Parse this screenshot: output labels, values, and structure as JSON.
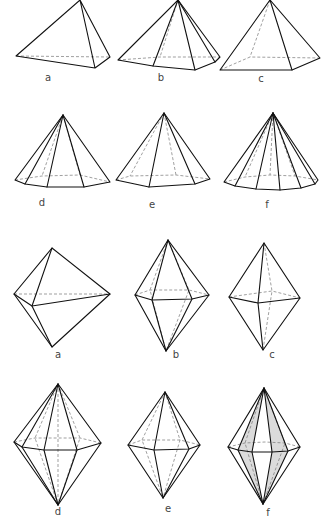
{
  "diagram": {
    "title": "",
    "width": 324,
    "height": 524,
    "colors": {
      "line": "#111111",
      "hidden_line": "#777777",
      "shade": "#cfcfcf",
      "label": "#444444"
    }
  },
  "pyramids": [
    {
      "id": "a",
      "label": "a",
      "label_pos": [
        48,
        81
      ],
      "solid": [
        [
          [
            80,
            0
          ],
          [
            16,
            56
          ],
          [
            95,
            68
          ],
          [
            80,
            0
          ],
          [
            110,
            57
          ],
          [
            95,
            68
          ]
        ]
      ],
      "hidden": [
        [
          [
            16,
            56
          ],
          [
            110,
            57
          ]
        ]
      ],
      "shade": []
    },
    {
      "id": "b",
      "label": "b",
      "label_pos": [
        161,
        81
      ],
      "solid": [
        [
          [
            178,
            0
          ],
          [
            118,
            60
          ],
          [
            153,
            66
          ],
          [
            195,
            70
          ],
          [
            215,
            62
          ],
          [
            220,
            57
          ],
          [
            178,
            0
          ]
        ],
        [
          [
            178,
            0
          ],
          [
            153,
            66
          ]
        ],
        [
          [
            178,
            0
          ],
          [
            195,
            70
          ]
        ],
        [
          [
            178,
            0
          ],
          [
            215,
            62
          ]
        ]
      ],
      "hidden": [
        [
          [
            118,
            60
          ],
          [
            160,
            57
          ],
          [
            220,
            57
          ]
        ],
        [
          [
            178,
            0
          ],
          [
            160,
            57
          ]
        ]
      ],
      "shade": []
    },
    {
      "id": "c",
      "label": "c",
      "label_pos": [
        261,
        82
      ],
      "solid": [
        [
          [
            270,
            0
          ],
          [
            220,
            70
          ],
          [
            292,
            70
          ],
          [
            320,
            58
          ],
          [
            270,
            0
          ]
        ],
        [
          [
            270,
            0
          ],
          [
            292,
            70
          ]
        ]
      ],
      "hidden": [
        [
          [
            220,
            70
          ],
          [
            250,
            57
          ],
          [
            320,
            58
          ]
        ],
        [
          [
            270,
            0
          ],
          [
            250,
            57
          ]
        ]
      ],
      "shade": []
    },
    {
      "id": "d",
      "label": "d",
      "label_pos": [
        42,
        206
      ],
      "solid": [
        [
          [
            63,
            115
          ],
          [
            15,
            180
          ],
          [
            25,
            184
          ],
          [
            47,
            187
          ],
          [
            84,
            187
          ],
          [
            110,
            182
          ],
          [
            63,
            115
          ]
        ],
        [
          [
            63,
            115
          ],
          [
            25,
            184
          ]
        ],
        [
          [
            63,
            115
          ],
          [
            47,
            187
          ]
        ],
        [
          [
            63,
            115
          ],
          [
            84,
            187
          ]
        ]
      ],
      "hidden": [
        [
          [
            15,
            180
          ],
          [
            42,
            176
          ],
          [
            80,
            175
          ],
          [
            110,
            182
          ]
        ],
        [
          [
            63,
            115
          ],
          [
            42,
            176
          ]
        ],
        [
          [
            63,
            115
          ],
          [
            80,
            175
          ]
        ]
      ],
      "shade": []
    },
    {
      "id": "e",
      "label": "e",
      "label_pos": [
        152,
        208
      ],
      "solid": [
        [
          [
            164,
            113
          ],
          [
            116,
            180
          ],
          [
            149,
            187
          ],
          [
            195,
            184
          ],
          [
            210,
            179
          ],
          [
            164,
            113
          ]
        ],
        [
          [
            164,
            113
          ],
          [
            149,
            187
          ]
        ],
        [
          [
            164,
            113
          ],
          [
            195,
            184
          ]
        ]
      ],
      "hidden": [
        [
          [
            116,
            180
          ],
          [
            130,
            176
          ],
          [
            176,
            175
          ],
          [
            210,
            179
          ]
        ],
        [
          [
            164,
            113
          ],
          [
            130,
            176
          ]
        ],
        [
          [
            164,
            113
          ],
          [
            176,
            175
          ]
        ]
      ],
      "shade": []
    },
    {
      "id": "f",
      "label": "f",
      "label_pos": [
        267,
        208
      ],
      "solid": [
        [
          [
            273,
            113
          ],
          [
            224,
            182
          ],
          [
            235,
            186
          ],
          [
            256,
            189
          ],
          [
            280,
            190
          ],
          [
            301,
            188
          ],
          [
            315,
            184
          ],
          [
            318,
            180
          ],
          [
            273,
            113
          ]
        ],
        [
          [
            273,
            113
          ],
          [
            235,
            186
          ]
        ],
        [
          [
            273,
            113
          ],
          [
            256,
            189
          ]
        ],
        [
          [
            273,
            113
          ],
          [
            280,
            190
          ]
        ],
        [
          [
            273,
            113
          ],
          [
            301,
            188
          ]
        ],
        [
          [
            273,
            113
          ],
          [
            315,
            184
          ]
        ]
      ],
      "hidden": [
        [
          [
            224,
            182
          ],
          [
            245,
            177
          ],
          [
            270,
            175
          ],
          [
            295,
            176
          ],
          [
            318,
            180
          ]
        ],
        [
          [
            273,
            113
          ],
          [
            245,
            177
          ]
        ],
        [
          [
            273,
            113
          ],
          [
            270,
            175
          ]
        ],
        [
          [
            273,
            113
          ],
          [
            295,
            176
          ]
        ]
      ],
      "shade": []
    }
  ],
  "bipyramids": [
    {
      "id": "a",
      "label": "a",
      "label_pos": [
        58,
        358
      ],
      "solid": [
        [
          [
            52,
            248
          ],
          [
            14,
            294
          ],
          [
            52,
            347
          ],
          [
            110,
            294
          ],
          [
            52,
            248
          ]
        ],
        [
          [
            52,
            248
          ],
          [
            32,
            306
          ],
          [
            52,
            347
          ]
        ],
        [
          [
            14,
            294
          ],
          [
            32,
            306
          ],
          [
            110,
            294
          ]
        ]
      ],
      "hidden": [
        [
          [
            14,
            294
          ],
          [
            110,
            294
          ]
        ]
      ],
      "shade": []
    },
    {
      "id": "b",
      "label": "b",
      "label_pos": [
        176,
        358
      ],
      "solid": [
        [
          [
            168,
            240
          ],
          [
            135,
            295
          ],
          [
            166,
            351
          ],
          [
            209,
            295
          ],
          [
            168,
            240
          ]
        ],
        [
          [
            135,
            295
          ],
          [
            152,
            300
          ],
          [
            192,
            299
          ],
          [
            209,
            295
          ]
        ],
        [
          [
            168,
            240
          ],
          [
            152,
            300
          ],
          [
            166,
            351
          ]
        ],
        [
          [
            168,
            240
          ],
          [
            192,
            299
          ],
          [
            166,
            351
          ]
        ]
      ],
      "hidden": [
        [
          [
            135,
            295
          ],
          [
            150,
            290
          ],
          [
            189,
            290
          ],
          [
            209,
            295
          ]
        ],
        [
          [
            168,
            240
          ],
          [
            150,
            290
          ],
          [
            166,
            351
          ]
        ],
        [
          [
            168,
            240
          ],
          [
            189,
            290
          ],
          [
            166,
            351
          ]
        ]
      ],
      "shade": []
    },
    {
      "id": "c",
      "label": "c",
      "label_pos": [
        272,
        358
      ],
      "solid": [
        [
          [
            264,
            243
          ],
          [
            229,
            297
          ],
          [
            263,
            350
          ],
          [
            300,
            298
          ],
          [
            264,
            243
          ]
        ],
        [
          [
            229,
            297
          ],
          [
            258,
            303
          ],
          [
            300,
            298
          ]
        ],
        [
          [
            264,
            243
          ],
          [
            258,
            303
          ],
          [
            263,
            350
          ]
        ]
      ],
      "hidden": [
        [
          [
            229,
            297
          ],
          [
            272,
            291
          ],
          [
            300,
            298
          ]
        ],
        [
          [
            264,
            243
          ],
          [
            272,
            291
          ],
          [
            263,
            350
          ]
        ]
      ],
      "shade": []
    },
    {
      "id": "d",
      "label": "d",
      "label_pos": [
        58,
        515
      ],
      "solid": [
        [
          [
            58,
            384
          ],
          [
            14,
            442
          ],
          [
            58,
            505
          ],
          [
            101,
            443
          ],
          [
            58,
            384
          ]
        ],
        [
          [
            14,
            442
          ],
          [
            22,
            447
          ],
          [
            44,
            450
          ],
          [
            77,
            450
          ],
          [
            101,
            443
          ]
        ],
        [
          [
            58,
            384
          ],
          [
            22,
            447
          ],
          [
            58,
            505
          ]
        ],
        [
          [
            58,
            384
          ],
          [
            44,
            450
          ],
          [
            58,
            505
          ]
        ],
        [
          [
            58,
            384
          ],
          [
            77,
            450
          ],
          [
            58,
            505
          ]
        ]
      ],
      "hidden": [
        [
          [
            14,
            442
          ],
          [
            35,
            438
          ],
          [
            80,
            438
          ],
          [
            101,
            443
          ]
        ],
        [
          [
            58,
            384
          ],
          [
            35,
            438
          ],
          [
            58,
            505
          ]
        ],
        [
          [
            58,
            384
          ],
          [
            80,
            438
          ],
          [
            58,
            505
          ]
        ],
        [
          [
            58,
            384
          ],
          [
            58,
            505
          ]
        ]
      ],
      "shade": []
    },
    {
      "id": "e",
      "label": "e",
      "label_pos": [
        168,
        512
      ],
      "solid": [
        [
          [
            165,
            392
          ],
          [
            128,
            445
          ],
          [
            163,
            498
          ],
          [
            200,
            445
          ],
          [
            165,
            392
          ]
        ],
        [
          [
            128,
            445
          ],
          [
            154,
            450
          ],
          [
            189,
            449
          ],
          [
            200,
            445
          ]
        ],
        [
          [
            165,
            392
          ],
          [
            154,
            450
          ],
          [
            163,
            498
          ]
        ],
        [
          [
            165,
            392
          ],
          [
            189,
            449
          ],
          [
            163,
            498
          ]
        ]
      ],
      "hidden": [
        [
          [
            128,
            445
          ],
          [
            142,
            440
          ],
          [
            180,
            440
          ],
          [
            200,
            445
          ]
        ],
        [
          [
            165,
            392
          ],
          [
            142,
            440
          ],
          [
            163,
            498
          ]
        ],
        [
          [
            165,
            392
          ],
          [
            180,
            440
          ],
          [
            163,
            498
          ]
        ]
      ],
      "shade": []
    },
    {
      "id": "f",
      "label": "f",
      "label_pos": [
        268,
        516
      ],
      "solid": [
        [
          [
            264,
            388
          ],
          [
            228,
            447
          ],
          [
            263,
            504
          ],
          [
            300,
            447
          ],
          [
            264,
            388
          ]
        ],
        [
          [
            228,
            447
          ],
          [
            238,
            450
          ],
          [
            252,
            452
          ],
          [
            272,
            452
          ],
          [
            288,
            451
          ],
          [
            300,
            447
          ]
        ],
        [
          [
            264,
            388
          ],
          [
            238,
            450
          ],
          [
            263,
            504
          ]
        ],
        [
          [
            264,
            388
          ],
          [
            252,
            452
          ],
          [
            263,
            504
          ]
        ],
        [
          [
            264,
            388
          ],
          [
            272,
            452
          ],
          [
            263,
            504
          ]
        ],
        [
          [
            264,
            388
          ],
          [
            288,
            451
          ],
          [
            263,
            504
          ]
        ]
      ],
      "hidden": [
        [
          [
            228,
            447
          ],
          [
            245,
            443
          ],
          [
            265,
            442
          ],
          [
            285,
            443
          ],
          [
            300,
            447
          ]
        ],
        [
          [
            264,
            388
          ],
          [
            245,
            443
          ],
          [
            263,
            504
          ]
        ],
        [
          [
            264,
            388
          ],
          [
            285,
            443
          ],
          [
            263,
            504
          ]
        ]
      ],
      "shade": [
        [
          [
            264,
            388
          ],
          [
            238,
            450
          ],
          [
            252,
            452
          ]
        ],
        [
          [
            264,
            388
          ],
          [
            272,
            452
          ],
          [
            288,
            451
          ]
        ],
        [
          [
            263,
            504
          ],
          [
            238,
            450
          ],
          [
            252,
            452
          ]
        ],
        [
          [
            263,
            504
          ],
          [
            272,
            452
          ],
          [
            288,
            451
          ]
        ]
      ]
    }
  ]
}
